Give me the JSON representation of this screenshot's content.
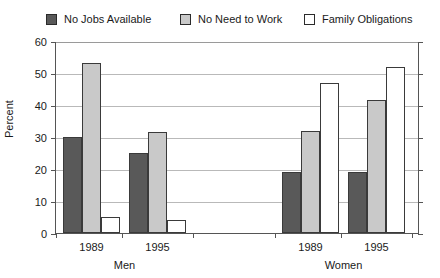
{
  "chart_data": {
    "type": "bar",
    "title": "",
    "xlabel": "",
    "ylabel": "Percent",
    "ylim": [
      0,
      60
    ],
    "yticks": [
      0,
      10,
      20,
      30,
      40,
      50,
      60
    ],
    "grid": true,
    "legend_position": "top",
    "categories": [
      "1989",
      "1995",
      "1989",
      "1995"
    ],
    "groups": [
      {
        "name": "Men",
        "categories": [
          "1989",
          "1995"
        ]
      },
      {
        "name": "Women",
        "categories": [
          "1989",
          "1995"
        ]
      }
    ],
    "series": [
      {
        "name": "No Jobs Available",
        "color": "#595959",
        "values": [
          30,
          25,
          19,
          19
        ]
      },
      {
        "name": "No Need to Work",
        "color": "#c9c9c9",
        "values": [
          53,
          31.5,
          32,
          41.5
        ]
      },
      {
        "name": "Family Obligations",
        "color": "#ffffff",
        "values": [
          5,
          4,
          47,
          52
        ]
      }
    ]
  },
  "legend": {
    "items": [
      {
        "label": "No Jobs Available",
        "swatch": "#595959"
      },
      {
        "label": "No Need to Work",
        "swatch": "#c9c9c9"
      },
      {
        "label": "Family Obligations",
        "swatch": "#ffffff"
      }
    ]
  },
  "axis": {
    "y_title": "Percent",
    "y_tick_labels": [
      "60",
      "50",
      "40",
      "30",
      "20",
      "10",
      "0"
    ],
    "x_category_labels": [
      "1989",
      "1995",
      "1989",
      "1995"
    ],
    "x_group_labels": [
      "Men",
      "Women"
    ]
  }
}
